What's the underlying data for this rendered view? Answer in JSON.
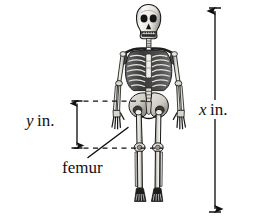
{
  "figure": {
    "background_color": "#ffffff",
    "ink_color": "#111111",
    "width": 260,
    "height": 222
  },
  "annotations": {
    "height_dimension": {
      "name": "x-dimension",
      "variable": "x",
      "unit": "in.",
      "label": "x in.",
      "description": "total standing height of the skeleton",
      "arrow": {
        "orientation": "vertical",
        "heads": "both",
        "x": 215,
        "y_top": 10,
        "y_bottom": 210,
        "cap_top": 8,
        "cap_bottom": 212
      }
    },
    "femur_dimension": {
      "name": "y-dimension",
      "variable": "y",
      "unit": "in.",
      "label": "y in.",
      "description": "femur length from hip to knee",
      "arrow": {
        "orientation": "vertical",
        "heads": "both",
        "x": 77,
        "y_top": 101,
        "y_bottom": 148,
        "cap_top": 101,
        "cap_bottom": 148
      }
    },
    "femur_callout": {
      "name": "femur-callout",
      "label": "femur",
      "leader_line": {
        "from_x": 88,
        "from_y": 157,
        "to_x": 128,
        "to_y": 128
      }
    },
    "guide_lines": [
      {
        "name": "hip-guide-line",
        "y": 101,
        "x_start": 74,
        "x_end": 148,
        "style": "dashed"
      },
      {
        "name": "knee-guide-line",
        "y": 148,
        "x_start": 74,
        "x_end": 163,
        "style": "dashed"
      }
    ]
  },
  "skeleton": {
    "name": "human-skeleton",
    "pose": "standing, anterior view, arms at sides",
    "parts": [
      "skull",
      "mandible",
      "cervical-spine",
      "clavicle",
      "scapula",
      "ribcage",
      "sternum",
      "lumbar-spine",
      "pelvis",
      "humerus",
      "radius",
      "ulna",
      "hand",
      "femur",
      "patella",
      "tibia",
      "fibula",
      "foot"
    ]
  }
}
